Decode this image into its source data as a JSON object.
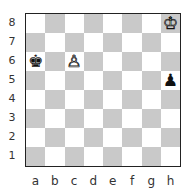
{
  "diagram": {
    "type": "chess-position",
    "ranks": [
      "8",
      "7",
      "6",
      "5",
      "4",
      "3",
      "2",
      "1"
    ],
    "files": [
      "a",
      "b",
      "c",
      "d",
      "e",
      "f",
      "g",
      "h"
    ],
    "pieces": [
      {
        "square": "h8",
        "piece": "king",
        "color": "white",
        "glyph": "♔"
      },
      {
        "square": "a6",
        "piece": "king",
        "color": "black",
        "glyph": "♚"
      },
      {
        "square": "c6",
        "piece": "pawn",
        "color": "white",
        "glyph": "♙"
      },
      {
        "square": "h5",
        "piece": "pawn",
        "color": "black",
        "glyph": "♟"
      }
    ],
    "colors": {
      "light_square": "#ffffff",
      "dark_square": "#c9c9c9",
      "border": "#222222"
    }
  }
}
